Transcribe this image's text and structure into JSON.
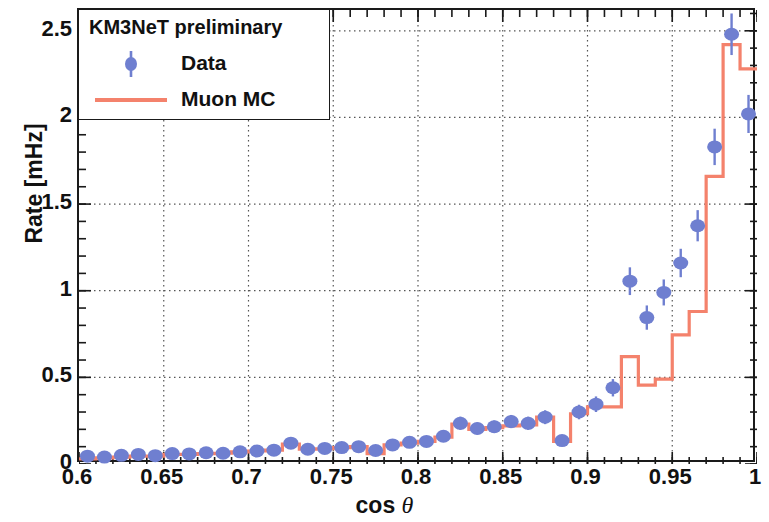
{
  "figure": {
    "xlabel_prefix": "cos",
    "xlabel_symbol": "θ",
    "ylabel": "Rate [mHz]"
  },
  "legend": {
    "title": "KM3NeT preliminary",
    "entries": [
      {
        "label": "Data",
        "marker": "point-with-error-bar",
        "color": "#6f7fd0"
      },
      {
        "label": "Muon MC",
        "marker": "line",
        "color": "#f4826c"
      }
    ]
  },
  "colors": {
    "data_marker": "#6f7fd0",
    "mc_line": "#f4826c",
    "axis": "#1a1a1a",
    "grid": "#555555",
    "background": "#ffffff"
  },
  "chart_data": {
    "type": "line",
    "title": "KM3NeT preliminary",
    "xlabel": "cos θ",
    "ylabel": "Rate [mHz]",
    "xlim": [
      0.6,
      1.0
    ],
    "ylim": [
      0.0,
      2.62
    ],
    "grid": true,
    "grid_style": "dotted",
    "legend_position": "upper-left",
    "xticks": [
      0.6,
      0.65,
      0.7,
      0.75,
      0.8,
      0.85,
      0.9,
      0.95,
      1.0
    ],
    "xtick_labels": [
      "0.6",
      "0.65",
      "0.7",
      "0.75",
      "0.8",
      "0.85",
      "0.9",
      "0.95",
      "1"
    ],
    "yticks": [
      0,
      0.5,
      1,
      1.5,
      2,
      2.5
    ],
    "ytick_labels": [
      "0",
      "0.5",
      "1",
      "1.5",
      "2",
      "2.5"
    ],
    "x_minor_tick_step": 0.01,
    "y_minor_tick_step": 0.1,
    "bin_width": 0.01,
    "bin_edges": [
      0.6,
      0.61,
      0.62,
      0.63,
      0.64,
      0.65,
      0.66,
      0.67,
      0.68,
      0.69,
      0.7,
      0.71,
      0.72,
      0.73,
      0.74,
      0.75,
      0.76,
      0.77,
      0.78,
      0.79,
      0.8,
      0.81,
      0.82,
      0.83,
      0.84,
      0.85,
      0.86,
      0.87,
      0.88,
      0.89,
      0.9,
      0.91,
      0.92,
      0.93,
      0.94,
      0.95,
      0.96,
      0.97,
      0.98,
      0.99,
      1.0
    ],
    "series": [
      {
        "name": "Data",
        "type": "scatter",
        "marker": "circle",
        "color": "#6f7fd0",
        "has_error_bars": true,
        "x": [
          0.605,
          0.615,
          0.625,
          0.635,
          0.645,
          0.655,
          0.665,
          0.675,
          0.685,
          0.695,
          0.705,
          0.715,
          0.725,
          0.735,
          0.745,
          0.755,
          0.765,
          0.775,
          0.785,
          0.795,
          0.805,
          0.815,
          0.825,
          0.835,
          0.845,
          0.855,
          0.865,
          0.875,
          0.885,
          0.895,
          0.905,
          0.915,
          0.925,
          0.935,
          0.945,
          0.955,
          0.965,
          0.975,
          0.985,
          0.995
        ],
        "y": [
          0.045,
          0.04,
          0.05,
          0.055,
          0.048,
          0.06,
          0.058,
          0.065,
          0.062,
          0.07,
          0.075,
          0.08,
          0.12,
          0.085,
          0.09,
          0.095,
          0.1,
          0.078,
          0.11,
          0.125,
          0.13,
          0.16,
          0.235,
          0.205,
          0.215,
          0.245,
          0.235,
          0.27,
          0.135,
          0.3,
          0.345,
          0.44,
          1.055,
          0.845,
          0.99,
          1.16,
          1.375,
          1.83,
          2.48,
          2.02
        ],
        "yerr": [
          0.02,
          0.018,
          0.02,
          0.02,
          0.018,
          0.02,
          0.02,
          0.022,
          0.02,
          0.022,
          0.022,
          0.024,
          0.028,
          0.024,
          0.024,
          0.026,
          0.026,
          0.022,
          0.026,
          0.028,
          0.028,
          0.032,
          0.038,
          0.034,
          0.036,
          0.038,
          0.038,
          0.04,
          0.028,
          0.042,
          0.045,
          0.05,
          0.08,
          0.07,
          0.075,
          0.082,
          0.09,
          0.105,
          0.12,
          0.11
        ]
      },
      {
        "name": "Muon MC",
        "type": "step",
        "color": "#f4826c",
        "x": [
          0.605,
          0.615,
          0.625,
          0.635,
          0.645,
          0.655,
          0.665,
          0.675,
          0.685,
          0.695,
          0.705,
          0.715,
          0.725,
          0.735,
          0.745,
          0.755,
          0.765,
          0.775,
          0.785,
          0.795,
          0.805,
          0.815,
          0.825,
          0.835,
          0.845,
          0.855,
          0.865,
          0.875,
          0.885,
          0.895,
          0.905,
          0.915,
          0.925,
          0.935,
          0.945,
          0.955,
          0.965,
          0.975,
          0.985,
          0.995
        ],
        "y": [
          0.03,
          0.035,
          0.04,
          0.045,
          0.045,
          0.055,
          0.055,
          0.06,
          0.062,
          0.07,
          0.075,
          0.08,
          0.115,
          0.085,
          0.088,
          0.095,
          0.1,
          0.06,
          0.11,
          0.12,
          0.13,
          0.155,
          0.23,
          0.2,
          0.21,
          0.22,
          0.225,
          0.27,
          0.13,
          0.29,
          0.33,
          0.33,
          0.62,
          0.455,
          0.49,
          0.745,
          0.88,
          1.66,
          2.42,
          2.28
        ]
      }
    ]
  }
}
